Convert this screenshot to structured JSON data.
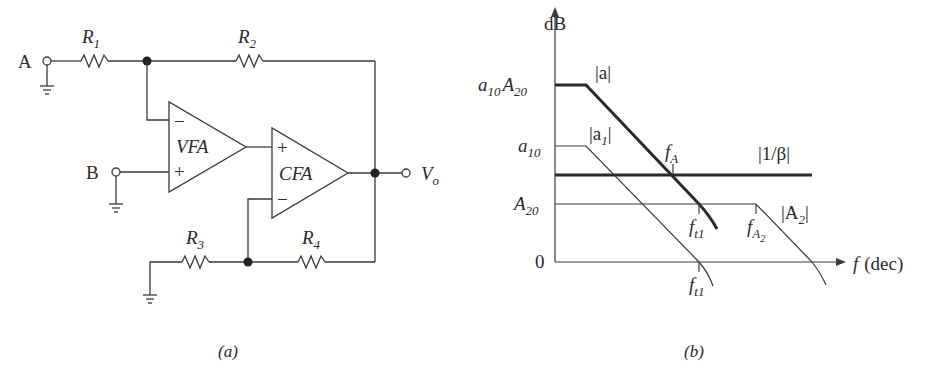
{
  "figure_a": {
    "caption": "(a)",
    "terminals": {
      "a_label": "A",
      "b_label": "B",
      "vo_label": "V",
      "vo_sub": "o"
    },
    "resistors": {
      "r1": "R",
      "r1_sub": "1",
      "r2": "R",
      "r2_sub": "2",
      "r3": "R",
      "r3_sub": "3",
      "r4": "R",
      "r4_sub": "4"
    },
    "amplifiers": {
      "vfa": {
        "label": "VFA",
        "minus": "−",
        "plus": "+"
      },
      "cfa": {
        "label": "CFA",
        "plus": "+",
        "minus": "−"
      }
    }
  },
  "figure_b": {
    "caption": "(b)",
    "y_axis_label": "dB",
    "x_axis_label": "f",
    "x_axis_unit": "(dec)",
    "y_levels": {
      "top": "a",
      "top_sub1": "10",
      "top_A": "A",
      "top_sub2": "20",
      "a10": "a",
      "a10_sub": "10",
      "A20": "A",
      "A20_sub": "20",
      "zero": "0"
    },
    "curves": {
      "a": "|a|",
      "a1_pre": "|a",
      "a1_sub": "1",
      "a1_post": "|",
      "beta": "|1/β|",
      "A2_pre": "|A",
      "A2_sub": "2",
      "A2_post": "|"
    },
    "markers": {
      "fA": "f",
      "fA_sub": "A",
      "ft1_upper": "f",
      "ft1_upper_sub": "t1",
      "fA2": "f",
      "fA2_sub": "A",
      "fA2_subsub": "2",
      "ft1_lower": "f",
      "ft1_lower_sub": "t1"
    }
  }
}
